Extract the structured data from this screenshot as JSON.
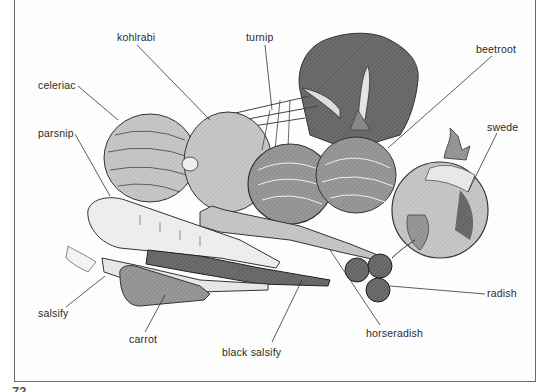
{
  "figure": {
    "type": "labelled illustration",
    "labels": [
      {
        "id": "kohlrabi",
        "text": "kohlrabi",
        "x": 117,
        "y": 31
      },
      {
        "id": "turnip",
        "text": "turnip",
        "x": 246,
        "y": 31
      },
      {
        "id": "beetroot",
        "text": "beetroot",
        "x": 476,
        "y": 43
      },
      {
        "id": "celeriac",
        "text": "celeriac",
        "x": 38,
        "y": 79
      },
      {
        "id": "swede",
        "text": "swede",
        "x": 487,
        "y": 121
      },
      {
        "id": "parsnip",
        "text": "parsnip",
        "x": 38,
        "y": 127
      },
      {
        "id": "radish",
        "text": "radish",
        "x": 487,
        "y": 287
      },
      {
        "id": "salsify",
        "text": "salsify",
        "x": 38,
        "y": 307
      },
      {
        "id": "horseradish",
        "text": "horseradish",
        "x": 366,
        "y": 327
      },
      {
        "id": "carrot",
        "text": "carrot",
        "x": 129,
        "y": 333
      },
      {
        "id": "black-salsify",
        "text": "black salsify",
        "x": 222,
        "y": 346
      }
    ]
  },
  "page": {
    "number": "72"
  }
}
